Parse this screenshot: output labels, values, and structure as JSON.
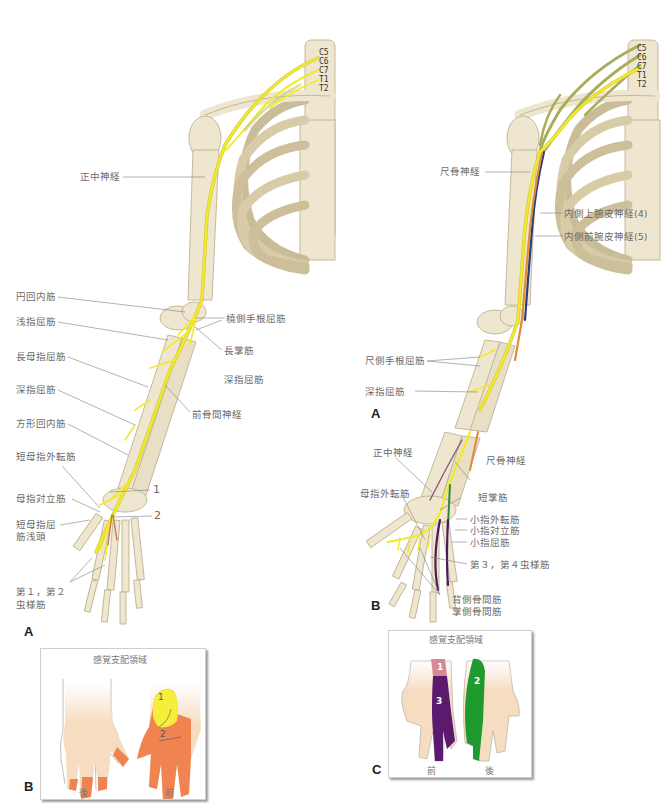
{
  "left_figure": {
    "spine_levels": [
      "C5",
      "C6",
      "C7",
      "T1",
      "T2"
    ],
    "nerve_label": "正中神経",
    "labels_left": [
      "円回内筋",
      "浅指屈筋",
      "長母指屈筋",
      "深指屈筋",
      "方形回内筋",
      "短母指外転筋",
      "母指対立筋",
      "短母指屈",
      "筋浅頭",
      "第１，第２",
      "虫様筋"
    ],
    "labels_right": [
      "橈側手根屈筋",
      "長掌筋",
      "深指屈筋",
      "前骨間神経"
    ],
    "numbers": [
      "1",
      "2"
    ],
    "panel_a": "A",
    "sensory_box": {
      "title": "感覚支配領域",
      "panel": "B",
      "hand_labels": [
        "後",
        "前"
      ],
      "region_numbers": [
        "1",
        "2"
      ],
      "colors": {
        "region1": "#f5ee3a",
        "region2": "#ef8450",
        "skin": "#f6dcc0"
      }
    }
  },
  "right_figure": {
    "spine_levels": [
      "C5",
      "C6",
      "C7",
      "T1",
      "T2"
    ],
    "labels_upper": [
      "尺骨神経",
      "内側上腕皮神経(4)",
      "内側前腕皮神経(5)",
      "尺側手根屈筋",
      "深指屈筋"
    ],
    "panel_a": "A",
    "hand_labels": [
      "正中神経",
      "尺骨神経",
      "母指外転筋",
      "短掌筋",
      "小指外転筋",
      "小指対立筋",
      "小指屈筋",
      "第３，第４虫様筋",
      "背側骨間筋",
      "掌側骨間筋"
    ],
    "panel_b": "B",
    "sensory_box": {
      "title": "感覚支配領域",
      "panel": "C",
      "hand_labels": [
        "前",
        "後"
      ],
      "region_numbers": [
        "1",
        "3",
        "2"
      ],
      "colors": {
        "region1": "#d9889a",
        "region3": "#5a1a6e",
        "region2": "#1e9a2e",
        "skin": "#f6dcc0"
      }
    }
  },
  "colors": {
    "bone": "#efe6cf",
    "bone_outline": "#b9ab8a",
    "nerve_yellow": "#f2ea2a",
    "plexus_olive": "#a9ad5a",
    "nerve_navy": "#2a3e7a",
    "nerve_orange": "#e08a3a",
    "label_text": "#6a6a6a",
    "leader_line": "#777777"
  }
}
